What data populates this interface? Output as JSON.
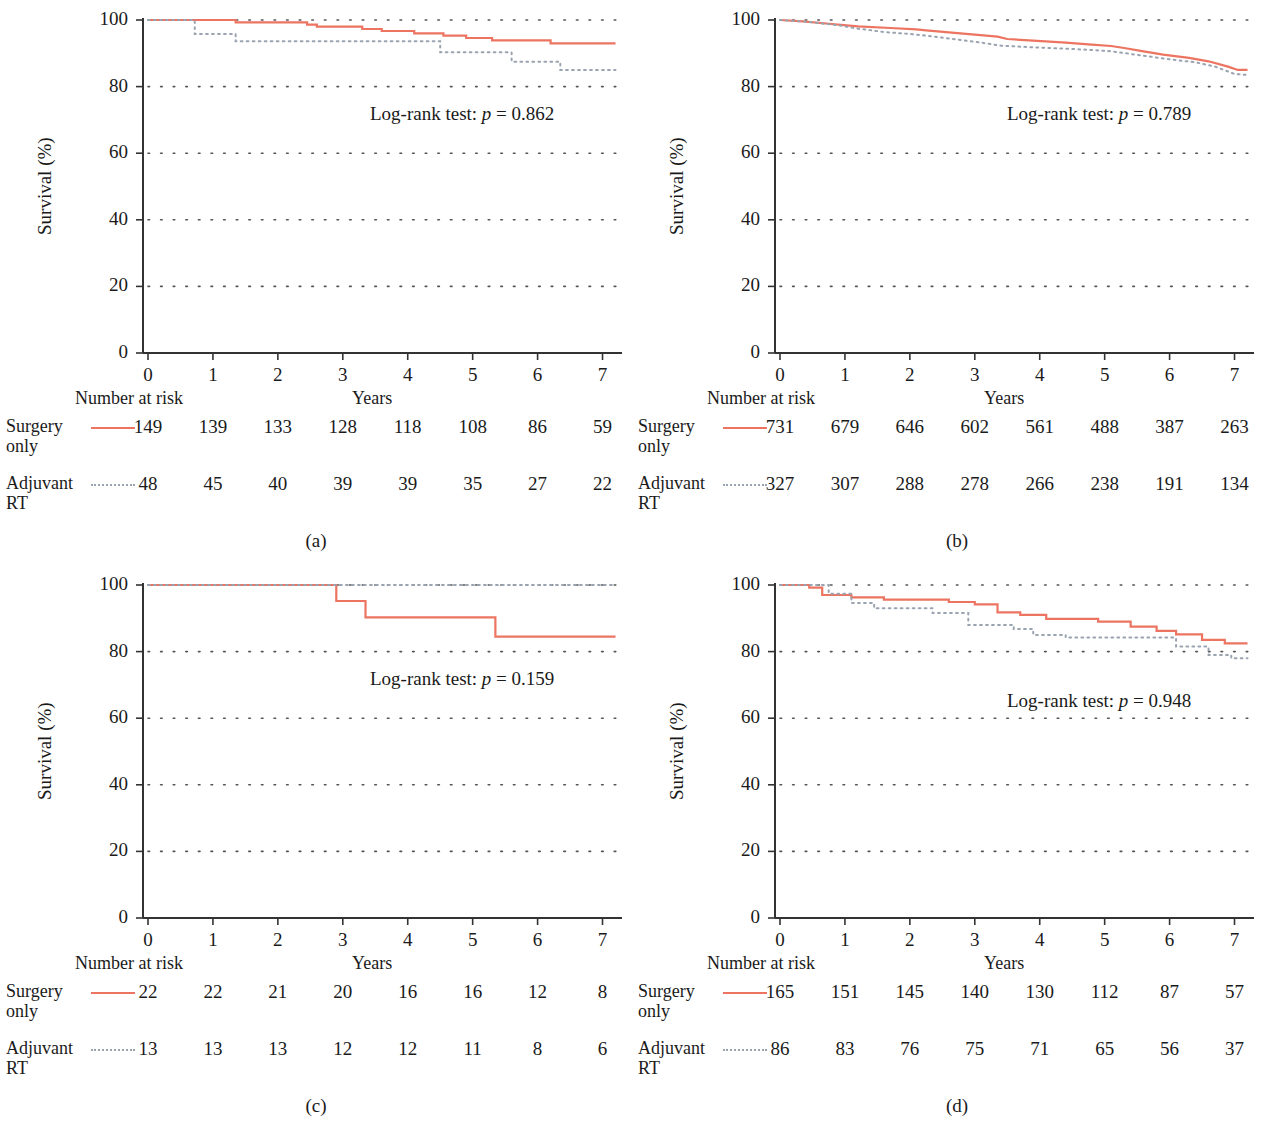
{
  "figure": {
    "axis_label_y": "Survival (%)",
    "axis_label_x": "Years",
    "risk_header": "Number at risk",
    "y_ticks": [
      "0",
      "20",
      "40",
      "60",
      "80",
      "100"
    ],
    "x_ticks": [
      "0",
      "1",
      "2",
      "3",
      "4",
      "5",
      "6",
      "7"
    ],
    "series_names": [
      "Surgery only",
      "Adjuvant RT"
    ],
    "colors": {
      "solid": "#ec7461",
      "dotted": "#9aa4b0",
      "text": "#1a1a1a",
      "grid": "#555555"
    }
  },
  "panels": [
    {
      "caption": "(a)",
      "pvalue_text": "Log-rank test: p = 0.862",
      "pvalue_prefix": "Log-rank test: ",
      "pvalue_italic": "p",
      "pvalue_suffix": " = 0.862",
      "risk_rows": [
        {
          "label_line1": "Surgery",
          "label_line2": "only",
          "style": "solid",
          "values": [
            "149",
            "139",
            "133",
            "128",
            "118",
            "108",
            "86",
            "59"
          ]
        },
        {
          "label_line1": "Adjuvant",
          "label_line2": "RT",
          "style": "dotted",
          "values": [
            "48",
            "45",
            "40",
            "39",
            "39",
            "35",
            "27",
            "22"
          ]
        }
      ]
    },
    {
      "caption": "(b)",
      "pvalue_text": "Log-rank test: p = 0.789",
      "pvalue_prefix": "Log-rank test: ",
      "pvalue_italic": "p",
      "pvalue_suffix": " = 0.789",
      "risk_rows": [
        {
          "label_line1": "Surgery",
          "label_line2": "only",
          "style": "solid",
          "values": [
            "731",
            "679",
            "646",
            "602",
            "561",
            "488",
            "387",
            "263"
          ]
        },
        {
          "label_line1": "Adjuvant",
          "label_line2": "RT",
          "style": "dotted",
          "values": [
            "327",
            "307",
            "288",
            "278",
            "266",
            "238",
            "191",
            "134"
          ]
        }
      ]
    },
    {
      "caption": "(c)",
      "pvalue_text": "Log-rank test: p = 0.159",
      "pvalue_prefix": "Log-rank test: ",
      "pvalue_italic": "p",
      "pvalue_suffix": " = 0.159",
      "risk_rows": [
        {
          "label_line1": "Surgery",
          "label_line2": "only",
          "style": "solid",
          "values": [
            "22",
            "22",
            "21",
            "20",
            "16",
            "16",
            "12",
            "8"
          ]
        },
        {
          "label_line1": "Adjuvant",
          "label_line2": "RT",
          "style": "dotted",
          "values": [
            "13",
            "13",
            "13",
            "12",
            "12",
            "11",
            "8",
            "6"
          ]
        }
      ]
    },
    {
      "caption": "(d)",
      "pvalue_text": "Log-rank test: p = 0.948",
      "pvalue_prefix": "Log-rank test: ",
      "pvalue_italic": "p",
      "pvalue_suffix": " = 0.948",
      "risk_rows": [
        {
          "label_line1": "Surgery",
          "label_line2": "only",
          "style": "solid",
          "values": [
            "165",
            "151",
            "145",
            "140",
            "130",
            "112",
            "87",
            "57"
          ]
        },
        {
          "label_line1": "Adjuvant",
          "label_line2": "RT",
          "style": "dotted",
          "values": [
            "86",
            "83",
            "76",
            "75",
            "71",
            "65",
            "56",
            "37"
          ]
        }
      ]
    }
  ],
  "chart_data": [
    {
      "type": "line",
      "panel": "(a)",
      "title": "",
      "xlabel": "Years",
      "ylabel": "Survival (%)",
      "xlim": [
        0,
        7.3
      ],
      "ylim": [
        0,
        100
      ],
      "xticks": [
        0,
        1,
        2,
        3,
        4,
        5,
        6,
        7
      ],
      "yticks": [
        0,
        20,
        40,
        60,
        80,
        100
      ],
      "grid": true,
      "legend": [
        "Surgery only",
        "Adjuvant RT"
      ],
      "annotation": "Log-rank test: p = 0.862",
      "series": [
        {
          "name": "Surgery only",
          "style": "solid",
          "steps": [
            [
              0,
              100
            ],
            [
              1.35,
              100
            ],
            [
              1.35,
              99.3
            ],
            [
              2.45,
              99.3
            ],
            [
              2.45,
              98.6
            ],
            [
              2.6,
              98.6
            ],
            [
              2.6,
              98.0
            ],
            [
              3.3,
              98.0
            ],
            [
              3.3,
              97.3
            ],
            [
              3.6,
              97.3
            ],
            [
              3.6,
              96.7
            ],
            [
              4.1,
              96.7
            ],
            [
              4.1,
              96.0
            ],
            [
              4.55,
              96.0
            ],
            [
              4.55,
              95.3
            ],
            [
              4.9,
              95.3
            ],
            [
              4.9,
              94.6
            ],
            [
              5.3,
              94.6
            ],
            [
              5.3,
              93.9
            ],
            [
              6.2,
              93.9
            ],
            [
              6.2,
              93.0
            ],
            [
              7.2,
              93.0
            ]
          ]
        },
        {
          "name": "Adjuvant RT",
          "style": "dotted",
          "steps": [
            [
              0,
              100
            ],
            [
              0.72,
              100
            ],
            [
              0.72,
              95.8
            ],
            [
              1.35,
              95.8
            ],
            [
              1.35,
              93.6
            ],
            [
              4.5,
              93.6
            ],
            [
              4.5,
              90.3
            ],
            [
              5.6,
              90.3
            ],
            [
              5.6,
              87.5
            ],
            [
              6.35,
              87.5
            ],
            [
              6.35,
              85.0
            ],
            [
              7.2,
              85.0
            ]
          ]
        }
      ]
    },
    {
      "type": "line",
      "panel": "(b)",
      "title": "",
      "xlabel": "Years",
      "ylabel": "Survival (%)",
      "xlim": [
        0,
        7.3
      ],
      "ylim": [
        0,
        100
      ],
      "xticks": [
        0,
        1,
        2,
        3,
        4,
        5,
        6,
        7
      ],
      "yticks": [
        0,
        20,
        40,
        60,
        80,
        100
      ],
      "grid": true,
      "legend": [
        "Surgery only",
        "Adjuvant RT"
      ],
      "annotation": "Log-rank test: p = 0.789",
      "series": [
        {
          "name": "Surgery only",
          "style": "solid",
          "steps": [
            [
              0,
              100
            ],
            [
              0.35,
              99.6
            ],
            [
              0.8,
              98.8
            ],
            [
              1.2,
              98.1
            ],
            [
              1.7,
              97.6
            ],
            [
              2.1,
              97.2
            ],
            [
              2.25,
              96.9
            ],
            [
              2.6,
              96.3
            ],
            [
              3.0,
              95.6
            ],
            [
              3.35,
              95.0
            ],
            [
              3.5,
              94.3
            ],
            [
              3.9,
              93.8
            ],
            [
              4.4,
              93.2
            ],
            [
              4.8,
              92.6
            ],
            [
              5.1,
              92.2
            ],
            [
              5.3,
              91.6
            ],
            [
              5.6,
              90.6
            ],
            [
              5.9,
              89.6
            ],
            [
              6.3,
              88.6
            ],
            [
              6.6,
              87.6
            ],
            [
              6.9,
              86.0
            ],
            [
              7.05,
              85.0
            ],
            [
              7.2,
              85.0
            ]
          ]
        },
        {
          "name": "Adjuvant RT",
          "style": "dotted",
          "steps": [
            [
              0,
              100
            ],
            [
              0.4,
              99.5
            ],
            [
              0.9,
              98.4
            ],
            [
              1.2,
              97.4
            ],
            [
              1.6,
              96.4
            ],
            [
              2.0,
              95.8
            ],
            [
              2.3,
              95.2
            ],
            [
              2.7,
              94.2
            ],
            [
              3.1,
              93.2
            ],
            [
              3.4,
              92.3
            ],
            [
              3.9,
              91.8
            ],
            [
              4.4,
              91.4
            ],
            [
              4.8,
              91.0
            ],
            [
              5.1,
              90.6
            ],
            [
              5.4,
              89.8
            ],
            [
              5.7,
              89.0
            ],
            [
              6.0,
              88.2
            ],
            [
              6.4,
              87.3
            ],
            [
              6.7,
              86.0
            ],
            [
              7.0,
              83.8
            ],
            [
              7.2,
              83.5
            ]
          ]
        }
      ]
    },
    {
      "type": "line",
      "panel": "(c)",
      "title": "",
      "xlabel": "Years",
      "ylabel": "Survival (%)",
      "xlim": [
        0,
        7.3
      ],
      "ylim": [
        0,
        100
      ],
      "xticks": [
        0,
        1,
        2,
        3,
        4,
        5,
        6,
        7
      ],
      "yticks": [
        0,
        20,
        40,
        60,
        80,
        100
      ],
      "grid": true,
      "legend": [
        "Surgery only",
        "Adjuvant RT"
      ],
      "annotation": "Log-rank test: p = 0.159",
      "series": [
        {
          "name": "Surgery only",
          "style": "solid",
          "steps": [
            [
              0,
              100
            ],
            [
              2.9,
              100
            ],
            [
              2.9,
              95.2
            ],
            [
              3.35,
              95.2
            ],
            [
              3.35,
              90.3
            ],
            [
              5.35,
              90.3
            ],
            [
              5.35,
              84.5
            ],
            [
              7.2,
              84.5
            ]
          ]
        },
        {
          "name": "Adjuvant RT",
          "style": "dotted",
          "steps": [
            [
              0,
              100
            ],
            [
              7.2,
              100
            ]
          ]
        }
      ]
    },
    {
      "type": "line",
      "panel": "(d)",
      "title": "",
      "xlabel": "Years",
      "ylabel": "Survival (%)",
      "xlim": [
        0,
        7.3
      ],
      "ylim": [
        0,
        100
      ],
      "xticks": [
        0,
        1,
        2,
        3,
        4,
        5,
        6,
        7
      ],
      "yticks": [
        0,
        20,
        40,
        60,
        80,
        100
      ],
      "grid": true,
      "legend": [
        "Surgery only",
        "Adjuvant RT"
      ],
      "annotation": "Log-rank test: p = 0.948",
      "series": [
        {
          "name": "Surgery only",
          "style": "solid",
          "steps": [
            [
              0,
              100
            ],
            [
              0.45,
              100
            ],
            [
              0.45,
              99.2
            ],
            [
              0.65,
              99.2
            ],
            [
              0.65,
              97.0
            ],
            [
              1.1,
              97.0
            ],
            [
              1.1,
              96.3
            ],
            [
              1.6,
              96.3
            ],
            [
              1.6,
              95.6
            ],
            [
              2.6,
              95.6
            ],
            [
              2.6,
              94.9
            ],
            [
              3.0,
              94.9
            ],
            [
              3.0,
              94.2
            ],
            [
              3.35,
              94.2
            ],
            [
              3.35,
              91.8
            ],
            [
              3.7,
              91.8
            ],
            [
              3.7,
              91.0
            ],
            [
              4.1,
              91.0
            ],
            [
              4.1,
              89.8
            ],
            [
              4.9,
              89.8
            ],
            [
              4.9,
              89.0
            ],
            [
              5.4,
              89.0
            ],
            [
              5.4,
              87.5
            ],
            [
              5.8,
              87.5
            ],
            [
              5.8,
              86.2
            ],
            [
              6.1,
              86.2
            ],
            [
              6.1,
              85.2
            ],
            [
              6.5,
              85.2
            ],
            [
              6.5,
              83.5
            ],
            [
              6.85,
              83.5
            ],
            [
              6.85,
              82.5
            ],
            [
              7.2,
              82.5
            ]
          ]
        },
        {
          "name": "Adjuvant RT",
          "style": "dotted",
          "steps": [
            [
              0,
              100
            ],
            [
              0.75,
              100
            ],
            [
              0.75,
              97.4
            ],
            [
              1.1,
              97.4
            ],
            [
              1.1,
              94.6
            ],
            [
              1.45,
              94.6
            ],
            [
              1.45,
              93.0
            ],
            [
              2.35,
              93.0
            ],
            [
              2.35,
              91.6
            ],
            [
              2.9,
              91.6
            ],
            [
              2.9,
              88.0
            ],
            [
              3.6,
              88.0
            ],
            [
              3.6,
              86.8
            ],
            [
              3.9,
              86.8
            ],
            [
              3.9,
              85.0
            ],
            [
              4.4,
              85.0
            ],
            [
              4.4,
              84.2
            ],
            [
              6.1,
              84.2
            ],
            [
              6.1,
              81.5
            ],
            [
              6.6,
              81.5
            ],
            [
              6.6,
              79.0
            ],
            [
              6.95,
              79.0
            ],
            [
              6.95,
              78.0
            ],
            [
              7.2,
              78.0
            ]
          ]
        }
      ]
    }
  ]
}
